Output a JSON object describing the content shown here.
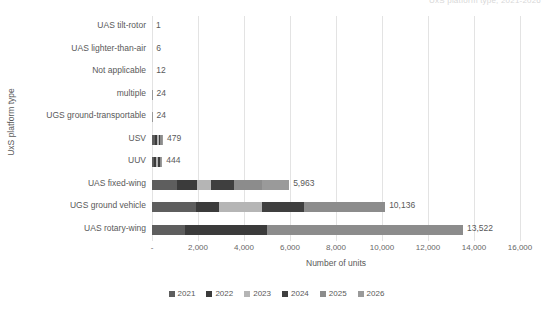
{
  "clipped_title": "UxS platform type, 2021-2026",
  "chart_data": {
    "type": "bar",
    "orientation": "horizontal",
    "stacked": true,
    "title": "",
    "xlabel": "Number of units",
    "ylabel": "UxS platform type",
    "xlim": [
      0,
      16000
    ],
    "grid": true,
    "legend_position": "bottom",
    "tick_labels": [
      "-",
      "2,000",
      "4,000",
      "6,000",
      "8,000",
      "10,000",
      "12,000",
      "14,000",
      "16,000"
    ],
    "tick_values": [
      0,
      2000,
      4000,
      6000,
      8000,
      10000,
      12000,
      14000,
      16000
    ],
    "categories": [
      "UAS tilt-rotor",
      "UAS lighter-than-air",
      "Not applicable",
      "multiple",
      "UGS ground-transportable",
      "USV",
      "UUV",
      "UAS fixed-wing",
      "UGS ground vehicle",
      "UAS rotary-wing"
    ],
    "totals": [
      1,
      6,
      12,
      24,
      24,
      479,
      444,
      5963,
      10136,
      13522
    ],
    "total_labels": [
      "1",
      "6",
      "12",
      "24",
      "24",
      "479",
      "444",
      "5,963",
      "10,136",
      "13,522"
    ],
    "series": [
      {
        "name": "2021",
        "color": "#5e5e5e",
        "values": [
          0,
          1,
          2,
          4,
          4,
          110,
          100,
          1100,
          1900,
          1450
        ]
      },
      {
        "name": "2022",
        "color": "#3b3b3b",
        "values": [
          0,
          1,
          2,
          4,
          4,
          95,
          85,
          850,
          1000,
          3550
        ]
      },
      {
        "name": "2023",
        "color": "#b5b5b5",
        "values": [
          0,
          1,
          2,
          4,
          4,
          80,
          75,
          600,
          1900,
          0
        ]
      },
      {
        "name": "2024",
        "color": "#3f3f3f",
        "values": [
          1,
          1,
          2,
          4,
          4,
          75,
          70,
          1000,
          1800,
          0
        ]
      },
      {
        "name": "2025",
        "color": "#8c8c8c",
        "values": [
          0,
          1,
          2,
          4,
          4,
          65,
          60,
          1250,
          3536,
          8522
        ]
      },
      {
        "name": "2026",
        "color": "#9a9a9a",
        "values": [
          0,
          1,
          2,
          4,
          4,
          54,
          54,
          1163,
          0,
          0
        ]
      }
    ]
  }
}
